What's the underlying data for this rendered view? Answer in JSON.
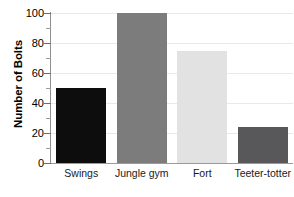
{
  "chart_data": {
    "type": "bar",
    "title": "",
    "xlabel": "",
    "ylabel": "Number of Bolts",
    "categories": [
      "Swings",
      "Jungle gym",
      "Fort",
      "Teeter-totter"
    ],
    "values": [
      50,
      100,
      75,
      24
    ],
    "bar_colors": [
      "#0d0d0d",
      "#7c7c7c",
      "#e2e2e2",
      "#58585a"
    ],
    "ylim": [
      0,
      100
    ],
    "yticks": [
      0,
      20,
      40,
      60,
      80,
      100
    ],
    "ytick_labels": [
      "0",
      "20",
      "40",
      "60",
      "80",
      "100"
    ],
    "yminor_ticks": [
      10,
      30,
      50,
      70,
      90
    ],
    "grid": true,
    "grid_axis": "y",
    "grid_color": "#e9e9e9",
    "legend": false,
    "axis_color": "#8f8f8f",
    "background": "#ffffff"
  }
}
